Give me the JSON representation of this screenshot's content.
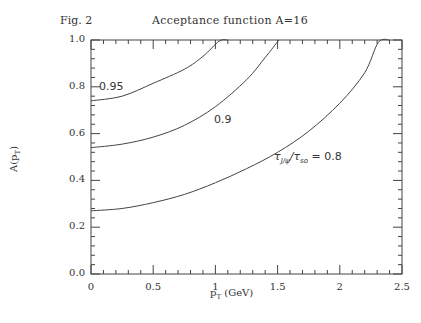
{
  "header": {
    "fig_label": "Fig. 2",
    "title": "Acceptance function A=16"
  },
  "axes": {
    "xlabel_main": "p",
    "xlabel_sub": "T",
    "xlabel_unit": " (GeV)",
    "ylabel_main": "A(p",
    "ylabel_sub": "T",
    "ylabel_end": ")",
    "xticks": [
      "0",
      "0.5",
      "1",
      "1.5",
      "2",
      "2.5"
    ],
    "yticks": [
      "0.0",
      "0.2",
      "0.4",
      "0.6",
      "0.8",
      "1.0"
    ]
  },
  "curve_labels": {
    "c095": "0.95",
    "c09": "0.9",
    "c08_prefix": "τ",
    "c08_sub1": "J/ψ",
    "c08_slash": "/τ",
    "c08_sub2": "so",
    "c08_value": " = 0.8"
  },
  "chart_data": {
    "type": "line",
    "title": "Acceptance function A=16",
    "annotation": "Fig. 2",
    "xlabel": "p_T (GeV)",
    "ylabel": "A(p_T)",
    "xlim": [
      0,
      2.5
    ],
    "ylim": [
      0.0,
      1.0
    ],
    "xticks": [
      0,
      0.5,
      1,
      1.5,
      2,
      2.5
    ],
    "yticks": [
      0.0,
      0.2,
      0.4,
      0.6,
      0.8,
      1.0
    ],
    "grid": false,
    "legend": "inline curve labels",
    "series": [
      {
        "name": "0.95",
        "x": [
          0,
          0.25,
          0.5,
          0.75,
          0.9,
          1.03,
          1.1
        ],
        "y": [
          0.74,
          0.76,
          0.815,
          0.875,
          0.93,
          0.995,
          1.0
        ]
      },
      {
        "name": "0.9",
        "x": [
          0,
          0.25,
          0.5,
          0.75,
          1.0,
          1.25,
          1.4,
          1.51
        ],
        "y": [
          0.54,
          0.555,
          0.585,
          0.635,
          0.715,
          0.83,
          0.925,
          1.0
        ]
      },
      {
        "name": "τJ/ψ/τso = 0.8",
        "x": [
          0,
          0.25,
          0.5,
          0.75,
          1.0,
          1.25,
          1.5,
          1.75,
          2.0,
          2.2,
          2.31,
          2.4
        ],
        "y": [
          0.27,
          0.28,
          0.305,
          0.34,
          0.39,
          0.45,
          0.52,
          0.61,
          0.73,
          0.86,
          0.99,
          1.0
        ]
      }
    ]
  }
}
